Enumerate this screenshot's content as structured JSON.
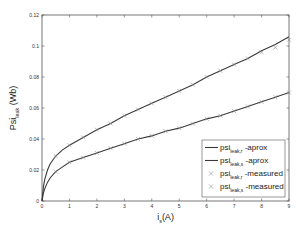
{
  "chart_data": {
    "type": "line",
    "title": "",
    "xlabel": "i_s(A)",
    "xlabel_main": "i",
    "xlabel_sub": "s",
    "xlabel_unit": "(A)",
    "ylabel": "Psi_leak (Wb)",
    "ylabel_main": "Psi",
    "ylabel_sub": "leak",
    "ylabel_unit": "(Wb)",
    "xlim": [
      0,
      9
    ],
    "ylim": [
      0,
      0.12
    ],
    "xticks": [
      "0",
      "1",
      "2",
      "3",
      "4",
      "5",
      "6",
      "7",
      "8",
      "9"
    ],
    "yticks": [
      "0",
      "0.02",
      "0.04",
      "0.06",
      "0.08",
      "0.1",
      "0.12"
    ],
    "grid": false,
    "legend_position": "lower right",
    "series": [
      {
        "name": "psi_leak,r -aprox",
        "style": "solid line",
        "x": [
          0,
          0.05,
          0.1,
          0.2,
          0.3,
          0.5,
          0.75,
          1,
          1.5,
          2,
          2.5,
          3,
          3.5,
          4,
          4.5,
          5,
          5.5,
          6,
          6.5,
          7,
          7.5,
          8,
          8.5,
          9
        ],
        "values": [
          0,
          0.009,
          0.014,
          0.02,
          0.024,
          0.029,
          0.033,
          0.036,
          0.041,
          0.046,
          0.05,
          0.055,
          0.059,
          0.063,
          0.067,
          0.071,
          0.075,
          0.08,
          0.084,
          0.088,
          0.092,
          0.097,
          0.101,
          0.106
        ]
      },
      {
        "name": "psi_leak,s -aprox",
        "style": "solid line",
        "x": [
          0,
          0.05,
          0.1,
          0.2,
          0.3,
          0.5,
          0.75,
          1,
          1.5,
          2,
          2.5,
          3,
          3.5,
          4,
          4.5,
          5,
          5.5,
          6,
          6.5,
          7,
          7.5,
          8,
          8.5,
          9
        ],
        "values": [
          0,
          0.005,
          0.008,
          0.012,
          0.015,
          0.019,
          0.022,
          0.025,
          0.028,
          0.031,
          0.034,
          0.037,
          0.04,
          0.042,
          0.045,
          0.047,
          0.05,
          0.053,
          0.055,
          0.058,
          0.061,
          0.064,
          0.067,
          0.07
        ]
      },
      {
        "name": "psi_leak,r -measured",
        "style": "x markers",
        "x": [
          0.5,
          1,
          1.5,
          2,
          2.5,
          3,
          3.5,
          4,
          4.5,
          5,
          5.5,
          6,
          6.5,
          7,
          7.5,
          8,
          8.5,
          9
        ],
        "values": [
          0.029,
          0.036,
          0.041,
          0.046,
          0.05,
          0.055,
          0.059,
          0.063,
          0.067,
          0.071,
          0.075,
          0.08,
          0.084,
          0.088,
          0.092,
          0.096,
          0.099,
          0.104
        ]
      },
      {
        "name": "psi_leak,s -measured",
        "style": "x markers",
        "x": [
          0.5,
          1,
          1.5,
          2,
          2.5,
          3,
          3.5,
          4,
          4.5,
          5,
          5.5,
          6,
          6.5,
          7,
          7.5,
          8,
          8.5,
          9
        ],
        "values": [
          0.019,
          0.025,
          0.028,
          0.031,
          0.034,
          0.037,
          0.04,
          0.042,
          0.045,
          0.047,
          0.05,
          0.053,
          0.055,
          0.058,
          0.061,
          0.064,
          0.067,
          0.07
        ]
      }
    ],
    "legend": [
      {
        "marker": "line",
        "main": "psi",
        "sub": "leak,r",
        "suffix": "-aprox"
      },
      {
        "marker": "line",
        "main": "psi",
        "sub": "leak,s",
        "suffix": "-aprox"
      },
      {
        "marker": "x",
        "main": "psi",
        "sub": "leak,r",
        "suffix": "-measured"
      },
      {
        "marker": "x",
        "main": "psi",
        "sub": "leak,s",
        "suffix": "-measured"
      }
    ]
  },
  "colors": {
    "line": "#3a3a3a",
    "marker": "#8a8a8a",
    "axis": "#555555",
    "background": "#ffffff"
  }
}
